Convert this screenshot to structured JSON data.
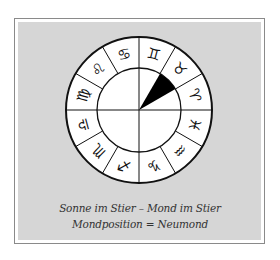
{
  "diagram": {
    "type": "zodiac-wheel",
    "center": [
      139,
      110
    ],
    "outer_radius": 73,
    "inner_radius": 42,
    "colors": {
      "background": "#d6d6d6",
      "wheel_fill": "#ffffff",
      "lines": "#111111",
      "moon_wedge": "#000000",
      "frame_border": "#8a8a8a",
      "caption": "#333333"
    },
    "signs": [
      {
        "name": "Gemini",
        "glyph": "♊",
        "angle": 75
      },
      {
        "name": "Taurus",
        "glyph": "♉",
        "angle": 45
      },
      {
        "name": "Aries",
        "glyph": "♈",
        "angle": 15
      },
      {
        "name": "Pisces",
        "glyph": "♓",
        "angle": -15
      },
      {
        "name": "Aquarius",
        "glyph": "♒",
        "angle": -45
      },
      {
        "name": "Capricorn",
        "glyph": "♑",
        "angle": -75
      },
      {
        "name": "Sagittarius",
        "glyph": "♐",
        "angle": -105
      },
      {
        "name": "Scorpio",
        "glyph": "♏",
        "angle": -135
      },
      {
        "name": "Libra",
        "glyph": "♎",
        "angle": -165
      },
      {
        "name": "Virgo",
        "glyph": "♍",
        "angle": 165
      },
      {
        "name": "Leo",
        "glyph": "♌",
        "angle": 135
      },
      {
        "name": "Cancer",
        "glyph": "♋",
        "angle": 105
      }
    ],
    "moon_wedge": {
      "sign": "Taurus",
      "start_angle": 30,
      "end_angle": 60
    }
  },
  "caption": {
    "line1": "Sonne im Stier – Mond im Stier",
    "line2": "Mondposition = Neumond"
  }
}
